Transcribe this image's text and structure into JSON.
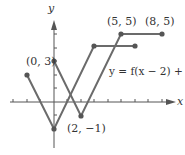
{
  "graph": {
    "axis_x_label": "x",
    "axis_y_label": "y",
    "equation_label": "y = f(x − 2) + 1",
    "point_labels": {
      "p1": "(0, 3)",
      "p2": "(2, −1)",
      "p3": "(5, 5)",
      "p4": "(8, 5)"
    },
    "colors": {
      "line": "#6b6b6b",
      "axis": "#555555"
    },
    "original_f_points": [
      [
        -2,
        2
      ],
      [
        0,
        -2
      ],
      [
        3,
        4
      ],
      [
        6,
        4
      ]
    ],
    "transformed_points": [
      [
        0,
        3
      ],
      [
        2,
        -1
      ],
      [
        5,
        5
      ],
      [
        8,
        5
      ]
    ]
  }
}
